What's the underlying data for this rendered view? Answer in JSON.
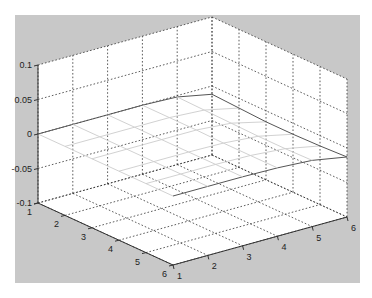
{
  "chart_data": {
    "type": "surface",
    "title": "",
    "xlabel": "",
    "ylabel": "",
    "zlabel": "",
    "x": [
      1,
      2,
      3,
      4,
      5,
      6
    ],
    "y": [
      1,
      2,
      3,
      4,
      5,
      6
    ],
    "xlim": [
      1,
      6
    ],
    "ylim": [
      1,
      6
    ],
    "zlim": [
      -0.1,
      0.1
    ],
    "x_ticks": [
      "1",
      "2",
      "3",
      "4",
      "5",
      "6"
    ],
    "y_ticks": [
      "1",
      "2",
      "3",
      "4",
      "5",
      "6"
    ],
    "z_ticks": [
      "-0.1",
      "-0.05",
      "0",
      "0.05",
      "0.1"
    ],
    "z_tick_values": [
      -0.1,
      -0.05,
      0,
      0.05,
      0.1
    ],
    "z": [
      [
        0,
        0,
        0,
        0,
        -0.002,
        -0.012
      ],
      [
        0,
        0,
        0,
        0,
        -0.003,
        -0.014
      ],
      [
        0,
        0,
        0,
        0,
        -0.004,
        -0.016
      ],
      [
        0,
        0,
        0,
        -0.001,
        -0.005,
        -0.016
      ],
      [
        0,
        0,
        0,
        -0.001,
        -0.005,
        -0.015
      ],
      [
        0,
        0,
        0,
        -0.001,
        -0.004,
        -0.013
      ]
    ],
    "grid": true,
    "colors": {
      "figure_background": "#c8c8c8",
      "axes_background": "#ffffff",
      "mesh": "#cccccc",
      "grid": "#333333"
    }
  }
}
